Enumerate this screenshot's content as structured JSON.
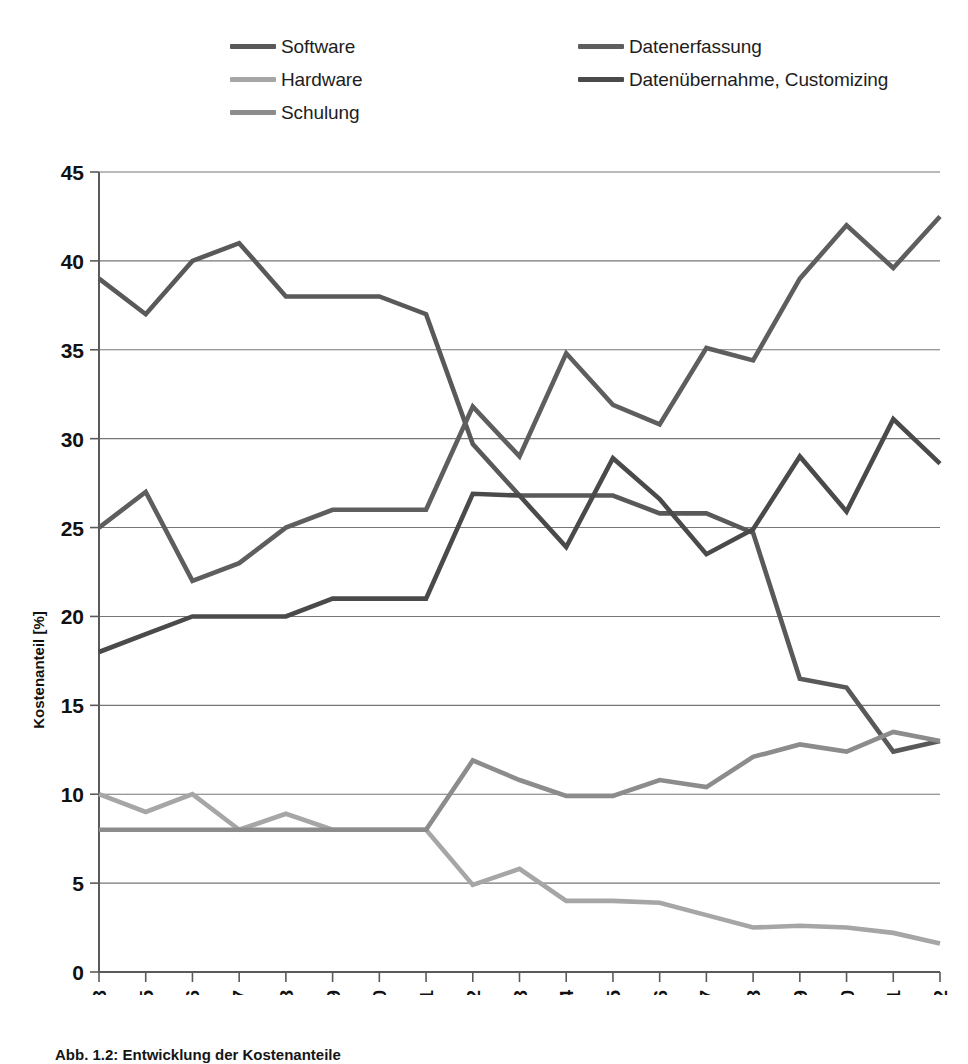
{
  "legend": {
    "position": "top",
    "columns": [
      {
        "items": [
          {
            "label": "Software",
            "color": "#595959",
            "swatch_name": "legend-swatch-software"
          },
          {
            "label": "Hardware",
            "color": "#a6a6a6",
            "swatch_name": "legend-swatch-hardware"
          },
          {
            "label": "Schulung",
            "color": "#8c8c8c",
            "swatch_name": "legend-swatch-schulung"
          }
        ]
      },
      {
        "items": [
          {
            "label": "Datenerfassung",
            "color": "#5e5e5e",
            "swatch_name": "legend-swatch-datenerfassung"
          },
          {
            "label": "Datenübernahme, Customizing",
            "color": "#4a4a4a",
            "swatch_name": "legend-swatch-datenuebernahme"
          }
        ]
      }
    ]
  },
  "axes": {
    "ylabel": "Kostenanteil [%]",
    "yticks": [
      "0",
      "5",
      "10",
      "15",
      "20",
      "25",
      "30",
      "35",
      "40",
      "45"
    ],
    "xticks": [
      "2003",
      "2005",
      "2006",
      "2007",
      "2008",
      "2009",
      "2010",
      "2011",
      "2012",
      "2013",
      "2014",
      "2015",
      "2016",
      "2017",
      "2018",
      "2019",
      "2020",
      "2021",
      "2022"
    ]
  },
  "caption": "Abb. 1.2: Entwicklung der Kostenanteile",
  "chart_data": {
    "type": "line",
    "title": "",
    "xlabel": "",
    "ylabel": "Kostenanteil [%]",
    "ylim": [
      0,
      45
    ],
    "ytick_step": 5,
    "grid": true,
    "legend_position": "top",
    "categories": [
      "2003",
      "2005",
      "2006",
      "2007",
      "2008",
      "2009",
      "2010",
      "2011",
      "2012",
      "2013",
      "2014",
      "2015",
      "2016",
      "2017",
      "2018",
      "2019",
      "2020",
      "2021",
      "2022"
    ],
    "series": [
      {
        "name": "Software",
        "color": "#595959",
        "values": [
          39.0,
          37.0,
          40.0,
          41.0,
          38.0,
          38.0,
          38.0,
          37.0,
          29.7,
          26.8,
          26.8,
          26.8,
          25.8,
          25.8,
          24.7,
          16.5,
          16.0,
          12.4,
          13.0
        ]
      },
      {
        "name": "Hardware",
        "color": "#a6a6a6",
        "values": [
          10.0,
          9.0,
          10.0,
          8.0,
          8.9,
          8.0,
          8.0,
          8.0,
          4.9,
          5.8,
          4.0,
          4.0,
          3.9,
          3.2,
          2.5,
          2.6,
          2.5,
          2.2,
          1.6
        ]
      },
      {
        "name": "Schulung",
        "color": "#8c8c8c",
        "values": [
          8.0,
          8.0,
          8.0,
          8.0,
          8.0,
          8.0,
          8.0,
          8.0,
          11.9,
          10.8,
          9.9,
          9.9,
          10.8,
          10.4,
          12.1,
          12.8,
          12.4,
          13.5,
          13.0
        ]
      },
      {
        "name": "Datenerfassung",
        "color": "#5e5e5e",
        "values": [
          25.0,
          27.0,
          22.0,
          23.0,
          25.0,
          26.0,
          26.0,
          26.0,
          31.8,
          29.0,
          34.8,
          31.9,
          30.8,
          35.1,
          34.4,
          39.0,
          42.0,
          39.6,
          42.5
        ]
      },
      {
        "name": "Datenübernahme, Customizing",
        "color": "#4a4a4a",
        "values": [
          18.0,
          19.0,
          20.0,
          20.0,
          20.0,
          21.0,
          21.0,
          21.0,
          26.9,
          26.8,
          23.9,
          28.9,
          26.6,
          23.5,
          24.9,
          29.0,
          25.9,
          31.1,
          28.6
        ]
      }
    ]
  }
}
